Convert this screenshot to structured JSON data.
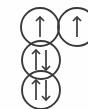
{
  "diagram": {
    "background_color": "#fefefe",
    "stroke_color": "#3a3a3a",
    "circle_radius": 19,
    "circle_stroke_width": 1.9,
    "arrow_stroke_width": 1.7,
    "arrow_length": 20,
    "arrow_head_size": 4,
    "orbitals": [
      {
        "name": "orbital-top-left",
        "label": "up",
        "cx": 40,
        "cy": 27,
        "electrons": [
          {
            "spin": "up",
            "offset_x": 0
          }
        ]
      },
      {
        "name": "orbital-top-right",
        "label": "up",
        "cx": 77,
        "cy": 27,
        "electrons": [
          {
            "spin": "up",
            "offset_x": 0
          }
        ]
      },
      {
        "name": "orbital-middle",
        "label": "up-down",
        "cx": 41,
        "cy": 60,
        "electrons": [
          {
            "spin": "up",
            "offset_x": -5
          },
          {
            "spin": "down",
            "offset_x": 5
          }
        ]
      },
      {
        "name": "orbital-bottom",
        "label": "up-down",
        "cx": 41,
        "cy": 90,
        "electrons": [
          {
            "spin": "up",
            "offset_x": -5
          },
          {
            "spin": "down",
            "offset_x": 5
          }
        ]
      }
    ]
  }
}
